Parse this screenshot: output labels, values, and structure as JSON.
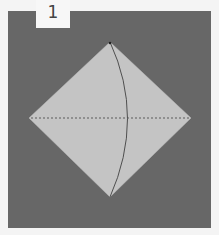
{
  "step": {
    "number": "1"
  },
  "colors": {
    "background": "#f4f4f4",
    "panel": "#676767",
    "paper": "#c4c4c4",
    "fold_line": "#555555",
    "tab": "#f7f7f7"
  },
  "diagram": {
    "shape": "diamond",
    "vertices": {
      "top": [
        110,
        42
      ],
      "right": [
        191,
        118
      ],
      "bottom": [
        110,
        197
      ],
      "left": [
        29,
        118
      ]
    },
    "lines": [
      {
        "type": "dashed",
        "name": "horizontal-valley-fold",
        "from": [
          31,
          118
        ],
        "to": [
          189,
          118
        ]
      },
      {
        "type": "solid-curve",
        "name": "curved-crease",
        "from": [
          110,
          42
        ],
        "to": [
          110,
          197
        ]
      }
    ]
  }
}
